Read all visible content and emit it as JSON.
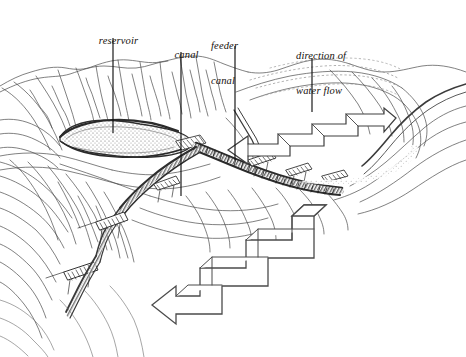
{
  "figure": {
    "type": "line-drawing-diagram",
    "style": "pen-and-ink hachure landscape perspective drawing",
    "background_color": "#ffffff",
    "ink_color": "#3a3a3a",
    "dark_ink_color": "#222222",
    "label_color": "#15110d"
  },
  "labels": [
    {
      "id": "reservoir",
      "text": "reservoir",
      "lines": [
        "reservoir"
      ],
      "x": 88,
      "y": 24,
      "align": "center",
      "leader": {
        "x": 113,
        "y_start": 38,
        "y_end": 133
      }
    },
    {
      "id": "canal",
      "text": "canal",
      "lines": [
        "canal"
      ],
      "x": 163,
      "y": 38,
      "align": "center",
      "leader": {
        "x": 181,
        "y_start": 52,
        "y_end": 196
      }
    },
    {
      "id": "feeder-canal",
      "text": "feeder canal",
      "lines": [
        "feeder",
        "canal"
      ],
      "x": 212,
      "y": 18,
      "align": "left",
      "leader": {
        "x": 235,
        "y_start": 46,
        "y_end": 160
      }
    },
    {
      "id": "direction-of-water-flow",
      "text": "direction of water flow",
      "lines": [
        "direction of",
        "water flow"
      ],
      "x": 297,
      "y": 28,
      "align": "left",
      "leader": {
        "x": 312,
        "y_start": 58,
        "y_end": 112
      }
    }
  ],
  "annotations": {
    "arrows": [
      {
        "id": "upper-flow-arrow",
        "description": "stepped three-dimensional block arrow pointing left along the upper ridge canal",
        "points_toward": "west"
      },
      {
        "id": "lower-flow-arrow",
        "description": "large stepped three-dimensional block arrow descending toward the lower left",
        "points_toward": "southwest"
      }
    ],
    "features": [
      {
        "id": "reservoir-basin",
        "description": "elongated stippled reservoir basin in the valley floor"
      },
      {
        "id": "main-canal",
        "description": "dark hatched canal band running diagonally down the slope"
      },
      {
        "id": "feeder-canal-line",
        "description": "feeder canal joining the main canal from the upper ridge"
      },
      {
        "id": "sluice-structures",
        "description": "small hatched weir and sluice structures along the canal"
      },
      {
        "id": "terrain-hachures",
        "description": "hill slopes rendered with contour and hachure strokes"
      },
      {
        "id": "river-valley",
        "description": "river channel descending to the right of the ridge"
      }
    ]
  }
}
